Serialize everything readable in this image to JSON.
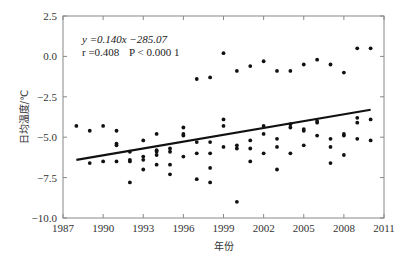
{
  "chart_data": {
    "type": "scatter",
    "title": "",
    "xlabel": "年份",
    "ylabel": "日均温度/℃",
    "xlim": [
      1987,
      2011
    ],
    "ylim": [
      -10.0,
      2.5
    ],
    "x_ticks": [
      "1987",
      "1990",
      "1993",
      "1996",
      "1999",
      "2002",
      "2005",
      "2008",
      "2011"
    ],
    "y_ticks": [
      "2.5",
      "0.0",
      "−2.5",
      "−5.0",
      "−7.5",
      "−10.0"
    ],
    "grid": false,
    "annotations": {
      "line1": "y =0.140x −285.07",
      "line2_r": "r =0.408",
      "line2_p": "P < 0.000 1"
    },
    "regression": {
      "slope": 0.14,
      "intercept": -285.07,
      "r": 0.408,
      "x_start": 1988,
      "y_start": -6.4,
      "x_end": 2010,
      "y_end": -3.3
    },
    "points": [
      [
        1988,
        -4.3
      ],
      [
        1989,
        -4.6
      ],
      [
        1989,
        -6.6
      ],
      [
        1990,
        -4.3
      ],
      [
        1990,
        -6.5
      ],
      [
        1991,
        -4.6
      ],
      [
        1991,
        -5.4
      ],
      [
        1991,
        -5.5
      ],
      [
        1991,
        -6.5
      ],
      [
        1992,
        -5.9
      ],
      [
        1992,
        -6.4
      ],
      [
        1992,
        -6.5
      ],
      [
        1992,
        -7.8
      ],
      [
        1993,
        -5.2
      ],
      [
        1993,
        -6.2
      ],
      [
        1993,
        -6.4
      ],
      [
        1993,
        -7.0
      ],
      [
        1994,
        -4.8
      ],
      [
        1994,
        -5.8
      ],
      [
        1994,
        -5.9
      ],
      [
        1994,
        -6.1
      ],
      [
        1994,
        -6.7
      ],
      [
        1995,
        -5.7
      ],
      [
        1995,
        -5.9
      ],
      [
        1995,
        -6.7
      ],
      [
        1995,
        -7.3
      ],
      [
        1996,
        -4.4
      ],
      [
        1996,
        -4.8
      ],
      [
        1996,
        -4.9
      ],
      [
        1996,
        -6.2
      ],
      [
        1997,
        -1.4
      ],
      [
        1997,
        -5.3
      ],
      [
        1997,
        -6.0
      ],
      [
        1997,
        -7.6
      ],
      [
        1998,
        -1.3
      ],
      [
        1998,
        -5.3
      ],
      [
        1998,
        -6.0
      ],
      [
        1998,
        -6.9
      ],
      [
        1998,
        -7.8
      ],
      [
        1999,
        0.2
      ],
      [
        1999,
        -3.9
      ],
      [
        1999,
        -4.3
      ],
      [
        1999,
        -5.6
      ],
      [
        2000,
        -0.9
      ],
      [
        2000,
        -5.5
      ],
      [
        2000,
        -5.7
      ],
      [
        2000,
        -9.0
      ],
      [
        2001,
        -0.6
      ],
      [
        2001,
        -5.2
      ],
      [
        2001,
        -5.7
      ],
      [
        2001,
        -6.5
      ],
      [
        2002,
        -0.3
      ],
      [
        2002,
        -4.3
      ],
      [
        2002,
        -4.8
      ],
      [
        2002,
        -6.0
      ],
      [
        2003,
        -0.9
      ],
      [
        2003,
        -5.1
      ],
      [
        2003,
        -5.6
      ],
      [
        2003,
        -7.0
      ],
      [
        2004,
        -0.9
      ],
      [
        2004,
        -4.2
      ],
      [
        2004,
        -4.4
      ],
      [
        2004,
        -6.0
      ],
      [
        2005,
        -0.5
      ],
      [
        2005,
        -4.5
      ],
      [
        2005,
        -4.6
      ],
      [
        2005,
        -5.5
      ],
      [
        2006,
        -0.2
      ],
      [
        2006,
        -4.0
      ],
      [
        2006,
        -4.1
      ],
      [
        2006,
        -4.9
      ],
      [
        2007,
        -0.5
      ],
      [
        2007,
        -5.1
      ],
      [
        2007,
        -5.6
      ],
      [
        2007,
        -6.6
      ],
      [
        2008,
        -1.0
      ],
      [
        2008,
        -4.8
      ],
      [
        2008,
        -4.9
      ],
      [
        2008,
        -6.1
      ],
      [
        2009,
        0.5
      ],
      [
        2009,
        -3.8
      ],
      [
        2009,
        -4.1
      ],
      [
        2009,
        -5.1
      ],
      [
        2010,
        0.5
      ],
      [
        2010,
        -3.9
      ],
      [
        2010,
        -5.2
      ]
    ],
    "colors": {
      "points": "#111111",
      "line": "#111111",
      "axis": "#888888"
    }
  }
}
